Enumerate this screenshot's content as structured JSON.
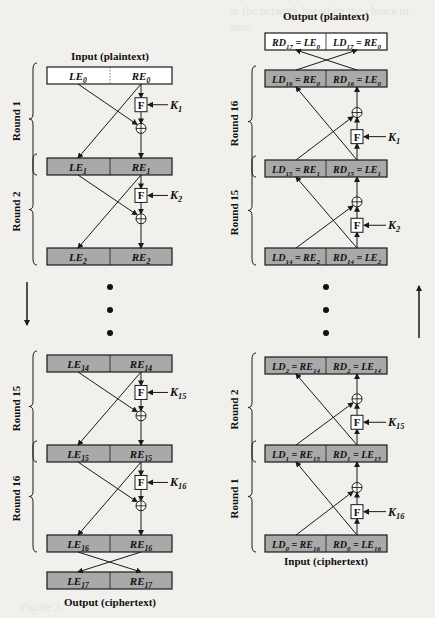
{
  "figure": {
    "colors": {
      "background": "#f1f0ed",
      "gray_box": "#a9a9a9",
      "white_box": "#ffffff",
      "stroke": "#1a1a1a"
    },
    "encryption": {
      "input_label": "Input (plaintext)",
      "output_label": "Output (ciphertext)",
      "rounds": [
        {
          "label": "Round 1",
          "key": "K",
          "key_sub": "1"
        },
        {
          "label": "Round 2",
          "key": "K",
          "key_sub": "2"
        },
        {
          "label": "Round 15",
          "key": "K",
          "key_sub": "15"
        },
        {
          "label": "Round 16",
          "key": "K",
          "key_sub": "16"
        }
      ],
      "blocks": [
        {
          "left": "LE",
          "left_sub": "0",
          "right": "RE",
          "right_sub": "0"
        },
        {
          "left": "LE",
          "left_sub": "1",
          "right": "RE",
          "right_sub": "1"
        },
        {
          "left": "LE",
          "left_sub": "2",
          "right": "RE",
          "right_sub": "2"
        },
        {
          "left": "LE",
          "left_sub": "14",
          "right": "RE",
          "right_sub": "14"
        },
        {
          "left": "LE",
          "left_sub": "15",
          "right": "RE",
          "right_sub": "15"
        },
        {
          "left": "LE",
          "left_sub": "16",
          "right": "RE",
          "right_sub": "16"
        },
        {
          "left": "LE",
          "left_sub": "17",
          "right": "RE",
          "right_sub": "17"
        }
      ],
      "direction": "down"
    },
    "decryption": {
      "input_label": "Input (ciphertext)",
      "output_label": "Output (plaintext)",
      "rounds": [
        {
          "label": "Round 16",
          "key": "K",
          "key_sub": "1"
        },
        {
          "label": "Round 15",
          "key": "K",
          "key_sub": "2"
        },
        {
          "label": "Round 2",
          "key": "K",
          "key_sub": "15"
        },
        {
          "label": "Round 1",
          "key": "K",
          "key_sub": "16"
        }
      ],
      "blocks": [
        {
          "l1": "RD",
          "l1s": "17",
          "l2": " = LE",
          "l2s": "0",
          "r1": "LD",
          "r1s": "17",
          "r2": " = RE",
          "r2s": "0"
        },
        {
          "l1": "LD",
          "l1s": "16",
          "l2": " = RE",
          "l2s": "0",
          "r1": "RD",
          "r1s": "16",
          "r2": " = LE",
          "r2s": "0"
        },
        {
          "l1": "LD",
          "l1s": "15",
          "l2": " = RE",
          "l2s": "1",
          "r1": "RD",
          "r1s": "15",
          "r2": " = LE",
          "r2s": "1"
        },
        {
          "l1": "LD",
          "l1s": "14",
          "l2": " = RE",
          "l2s": "2",
          "r1": "RD",
          "r1s": "14",
          "r2": " = LE",
          "r2s": "2"
        },
        {
          "l1": "LD",
          "l1s": "2",
          "l2": " = RE",
          "l2s": "14",
          "r1": "RD",
          "r1s": "2",
          "r2": " = LE",
          "r2s": "14"
        },
        {
          "l1": "LD",
          "l1s": "1",
          "l2": " = RE",
          "l2s": "15",
          "r1": "RD",
          "r1s": "1",
          "r2": " = LE",
          "r2s": "15"
        },
        {
          "l1": "LD",
          "l1s": "0",
          "l2": " = RE",
          "l2s": "16",
          "r1": "RD",
          "r1s": "0",
          "r2": " = LE",
          "r2s": "16"
        }
      ],
      "direction": "up"
    },
    "function_label": "F",
    "xor_symbol": "⊕"
  }
}
